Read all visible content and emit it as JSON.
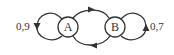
{
  "diagram": {
    "type": "state-transition",
    "colors": {
      "stroke": "#333333",
      "background": "#ffffff"
    },
    "nodes": [
      {
        "id": "A",
        "label": "A"
      },
      {
        "id": "B",
        "label": "B"
      }
    ],
    "edges": [
      {
        "from": "A",
        "to": "A",
        "label": "0,9"
      },
      {
        "from": "B",
        "to": "B",
        "label": "0,7"
      },
      {
        "from": "A",
        "to": "B",
        "label": ""
      },
      {
        "from": "B",
        "to": "A",
        "label": ""
      }
    ]
  }
}
